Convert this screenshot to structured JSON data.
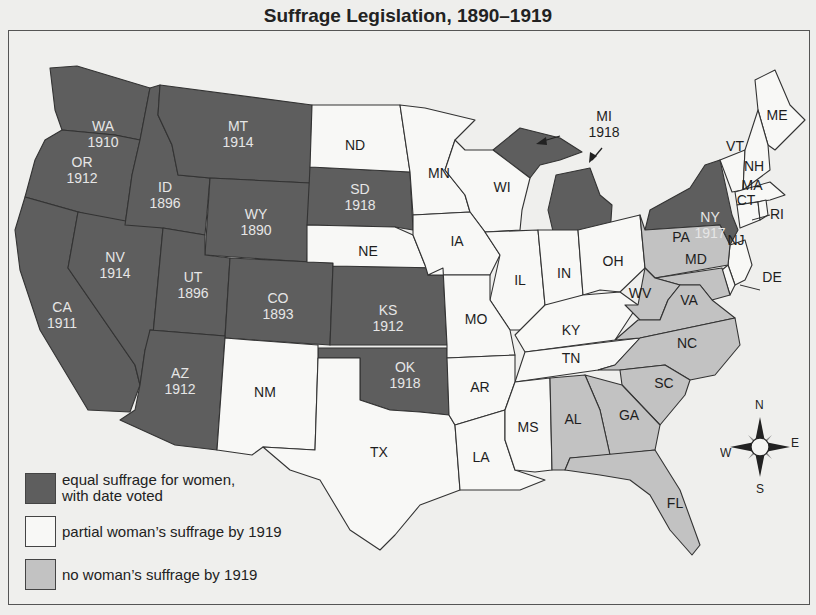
{
  "title": "Suffrage Legislation, 1890–1919",
  "colors": {
    "equal": "#5e5e5e",
    "partial": "#f8f8f6",
    "none": "#c2c2c2",
    "background": "#efefed",
    "border": "#333333"
  },
  "legend": {
    "items": [
      {
        "key": "equal",
        "label_line1": "equal suffrage for women,",
        "label_line2": "with date voted"
      },
      {
        "key": "partial",
        "label_line1": "partial woman’s suffrage by 1919",
        "label_line2": ""
      },
      {
        "key": "none",
        "label_line1": "no woman’s suffrage by 1919",
        "label_line2": ""
      }
    ]
  },
  "compass": {
    "n": "N",
    "e": "E",
    "s": "S",
    "w": "W"
  },
  "states": {
    "WA": {
      "abbr": "WA",
      "year": "1910",
      "status": "equal"
    },
    "OR": {
      "abbr": "OR",
      "year": "1912",
      "status": "equal"
    },
    "CA": {
      "abbr": "CA",
      "year": "1911",
      "status": "equal"
    },
    "NV": {
      "abbr": "NV",
      "year": "1914",
      "status": "equal"
    },
    "ID": {
      "abbr": "ID",
      "year": "1896",
      "status": "equal"
    },
    "MT": {
      "abbr": "MT",
      "year": "1914",
      "status": "equal"
    },
    "WY": {
      "abbr": "WY",
      "year": "1890",
      "status": "equal"
    },
    "UT": {
      "abbr": "UT",
      "year": "1896",
      "status": "equal"
    },
    "AZ": {
      "abbr": "AZ",
      "year": "1912",
      "status": "equal"
    },
    "CO": {
      "abbr": "CO",
      "year": "1893",
      "status": "equal"
    },
    "SD": {
      "abbr": "SD",
      "year": "1918",
      "status": "equal"
    },
    "KS": {
      "abbr": "KS",
      "year": "1912",
      "status": "equal"
    },
    "OK": {
      "abbr": "OK",
      "year": "1918",
      "status": "equal"
    },
    "MI": {
      "abbr": "MI",
      "year": "1918",
      "status": "equal"
    },
    "NY": {
      "abbr": "NY",
      "year": "1917",
      "status": "equal"
    },
    "ND": {
      "abbr": "ND",
      "status": "partial"
    },
    "NE": {
      "abbr": "NE",
      "status": "partial"
    },
    "NM": {
      "abbr": "NM",
      "status": "partial"
    },
    "TX": {
      "abbr": "TX",
      "status": "partial"
    },
    "MN": {
      "abbr": "MN",
      "status": "partial"
    },
    "IA": {
      "abbr": "IA",
      "status": "partial"
    },
    "MO": {
      "abbr": "MO",
      "status": "partial"
    },
    "AR": {
      "abbr": "AR",
      "status": "partial"
    },
    "LA": {
      "abbr": "LA",
      "status": "partial"
    },
    "WI": {
      "abbr": "WI",
      "status": "partial"
    },
    "IL": {
      "abbr": "IL",
      "status": "partial"
    },
    "IN": {
      "abbr": "IN",
      "status": "partial"
    },
    "OH": {
      "abbr": "OH",
      "status": "partial"
    },
    "KY": {
      "abbr": "KY",
      "status": "partial"
    },
    "TN": {
      "abbr": "TN",
      "status": "partial"
    },
    "MS": {
      "abbr": "MS",
      "status": "partial"
    },
    "ME": {
      "abbr": "ME",
      "status": "partial"
    },
    "VT": {
      "abbr": "VT",
      "status": "partial"
    },
    "NH": {
      "abbr": "NH",
      "status": "partial"
    },
    "MA": {
      "abbr": "MA",
      "status": "partial"
    },
    "CT": {
      "abbr": "CT",
      "status": "partial"
    },
    "RI": {
      "abbr": "RI",
      "status": "partial"
    },
    "NJ": {
      "abbr": "NJ",
      "status": "partial"
    },
    "DE": {
      "abbr": "DE",
      "status": "partial"
    },
    "PA": {
      "abbr": "PA",
      "status": "none"
    },
    "MD": {
      "abbr": "MD",
      "status": "none"
    },
    "WV": {
      "abbr": "WV",
      "status": "none"
    },
    "VA": {
      "abbr": "VA",
      "status": "none"
    },
    "NC": {
      "abbr": "NC",
      "status": "none"
    },
    "SC": {
      "abbr": "SC",
      "status": "none"
    },
    "GA": {
      "abbr": "GA",
      "status": "none"
    },
    "AL": {
      "abbr": "AL",
      "status": "none"
    },
    "FL": {
      "abbr": "FL",
      "status": "none"
    }
  }
}
